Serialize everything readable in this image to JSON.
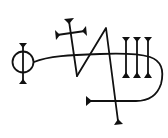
{
  "figure": {
    "kind": "sigil",
    "colors": {
      "ink": "#111111",
      "background": "#ffffff"
    },
    "elements": [
      {
        "name": "circle-with-vertical-bar",
        "center": [
          23,
          62
        ],
        "radius": 10,
        "bar": [
          [
            23,
            44
          ],
          [
            23,
            82
          ]
        ]
      },
      {
        "name": "cross",
        "vertical": [
          [
            69,
            21
          ],
          [
            77,
            76
          ]
        ],
        "arm": [
          [
            56,
            35
          ],
          [
            85,
            31
          ]
        ]
      },
      {
        "name": "zigzag",
        "points": [
          [
            77,
            76
          ],
          [
            106,
            28
          ],
          [
            119,
            123
          ]
        ]
      },
      {
        "name": "three-bars",
        "x": [
          126,
          137,
          148
        ],
        "y_top": 37,
        "y_bottom": 77
      },
      {
        "name": "looping-line",
        "from": [
          34,
          62
        ],
        "to": [
          87,
          101
        ]
      }
    ]
  }
}
